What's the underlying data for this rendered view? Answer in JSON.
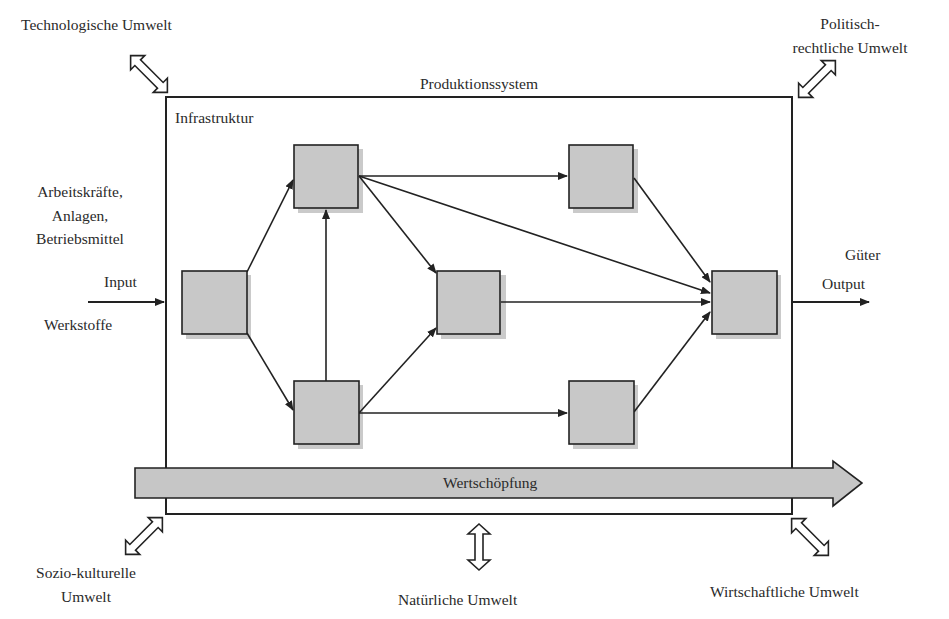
{
  "diagram": {
    "system_title": "Produktionssystem",
    "infrastructure_label": "Infrastruktur",
    "input": {
      "resources": [
        "Arbeitskräfte,",
        "Anlagen,",
        "Betriebsmittel"
      ],
      "label": "Input",
      "materials": "Werkstoffe"
    },
    "output": {
      "goods": "Güter",
      "label": "Output"
    },
    "value_chain_label": "Wertschöpfung",
    "environments": {
      "technological": "Technologische Umwelt",
      "political_line1": "Politisch-",
      "political_line2": "rechtliche Umwelt",
      "sociocultural_line1": "Sozio-kulturelle",
      "sociocultural_line2": "Umwelt",
      "natural": "Natürliche Umwelt",
      "economic": "Wirtschaftliche Umwelt"
    },
    "nodes": [
      {
        "id": "n1",
        "x": 182,
        "y": 271
      },
      {
        "id": "n2",
        "x": 294,
        "y": 145
      },
      {
        "id": "n3",
        "x": 294,
        "y": 381
      },
      {
        "id": "n4",
        "x": 437,
        "y": 271
      },
      {
        "id": "n5",
        "x": 569,
        "y": 145
      },
      {
        "id": "n6",
        "x": 569,
        "y": 381
      },
      {
        "id": "n7",
        "x": 712,
        "y": 271
      }
    ],
    "colors": {
      "node_fill": "#c8c8c8",
      "node_shadow": "#b4b4b4",
      "stroke": "#222222",
      "value_bar_fill": "#c6c6c6"
    }
  }
}
